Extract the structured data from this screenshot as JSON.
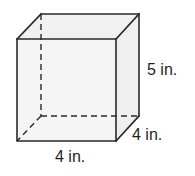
{
  "figure": {
    "shape": "rectangular prism",
    "dimensions": {
      "height": "5 in.",
      "depth": "4 in.",
      "width": "4 in."
    },
    "colors": {
      "edge": "#2a2a2a",
      "face_front": "#f5f5f5",
      "face_top": "#f1f1f1",
      "face_side": "#efefef",
      "label": "#1f1f1f"
    }
  },
  "labels": {
    "height_label": "5 in.",
    "depth_label": "4 in.",
    "width_label": "4 in."
  }
}
